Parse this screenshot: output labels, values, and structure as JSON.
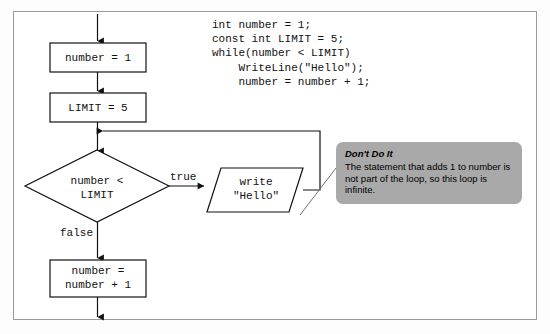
{
  "figure": {
    "kind": "flowchart",
    "border_color": "#9a9a9a",
    "background": "#ffffff"
  },
  "flowchart": {
    "nodes": [
      {
        "id": "init_number",
        "shape": "process",
        "text": "number = 1"
      },
      {
        "id": "init_limit",
        "shape": "process",
        "text": "LIMIT = 5"
      },
      {
        "id": "decision",
        "shape": "decision",
        "line1": "number <",
        "line2": "LIMIT"
      },
      {
        "id": "output",
        "shape": "io",
        "line1": "write",
        "line2": "\"Hello\""
      },
      {
        "id": "increment",
        "shape": "process",
        "line1": "number =",
        "line2": "number + 1"
      }
    ],
    "edge_labels": {
      "true": "true",
      "false": "false"
    }
  },
  "code": {
    "lines": [
      "int number = 1;",
      "const int LIMIT = 5;",
      "while(number < LIMIT)",
      "    WriteLine(\"Hello\");",
      "    number = number + 1;"
    ]
  },
  "callout": {
    "title": "Don't Do It",
    "body": "The statement that adds 1 to number is not part of the loop, so this loop is infinite.",
    "background": "#a9a9a9"
  }
}
